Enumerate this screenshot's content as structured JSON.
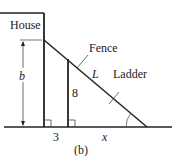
{
  "diagram": {
    "labels": {
      "house": "House",
      "fence": "Fence",
      "ladder": "Ladder",
      "ladder_length": "L",
      "height": "b",
      "fence_height": "8",
      "gap": "3",
      "distance": "x",
      "caption": "(b)"
    },
    "colors": {
      "line": "#222222",
      "background": "#ffffff"
    }
  }
}
